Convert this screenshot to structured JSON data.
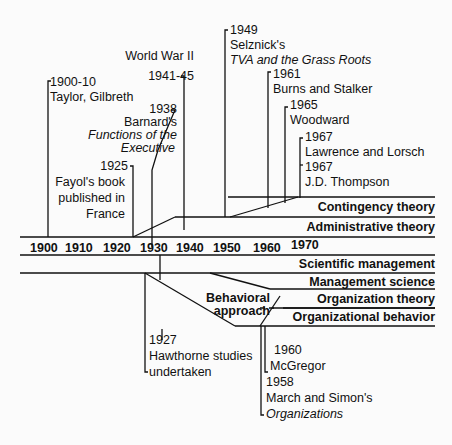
{
  "axis": {
    "years": [
      "1900",
      "1910",
      "1920",
      "1930",
      "1940",
      "1950",
      "1960",
      "1970"
    ]
  },
  "bands": {
    "contingency": "Contingency theory",
    "administrative": "Administrative theory",
    "scientific": "Scientific management",
    "management_science": "Management science",
    "organization_theory": "Organization theory",
    "organizational_behavior": "Organizational behavior",
    "behavioral_approach_1": "Behavioral",
    "behavioral_approach_2": "approach"
  },
  "events": {
    "e1900": {
      "year": "1900-10",
      "text": "Taylor, Gilbreth"
    },
    "e1925": {
      "year": "1925",
      "l1": "Fayol's book",
      "l2": "published in",
      "l3": "France"
    },
    "e1938": {
      "year": "1938",
      "l1": "Barnard's",
      "l2": "Functions of the",
      "l3": "Executive"
    },
    "ww2": {
      "l1": "World War II",
      "year": "1941-45"
    },
    "e1949": {
      "year": "1949",
      "l1": "Selznick's",
      "l2": "TVA and the Grass Roots"
    },
    "e1961": {
      "year": "1961",
      "text": "Burns and Stalker"
    },
    "e1965": {
      "year": "1965",
      "text": "Woodward"
    },
    "e1967a": {
      "year": "1967",
      "text": "Lawrence and Lorsch"
    },
    "e1967b": {
      "year": "1967",
      "text": "J.D. Thompson"
    },
    "e1927": {
      "year": "1927",
      "l1": "Hawthorne studies",
      "l2": "undertaken"
    },
    "e1960": {
      "year": "1960",
      "text": "McGregor"
    },
    "e1958": {
      "year": "1958",
      "l1": "March and Simon's",
      "l2": "Organizations"
    }
  }
}
